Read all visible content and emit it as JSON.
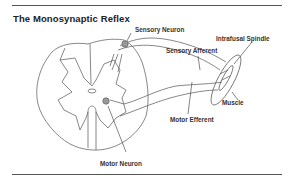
{
  "figure": {
    "title": "The Monosynaptic Reflex",
    "labels": {
      "sensory_neuron": "Sensory Neuron",
      "intrafusal_spindle": "Intrafusal Spindle",
      "sensory_afferent": "Sensory Afferent",
      "muscle": "Muscle",
      "motor_efferent": "Motor Efferent",
      "motor_neuron": "Motor Neuron"
    }
  }
}
